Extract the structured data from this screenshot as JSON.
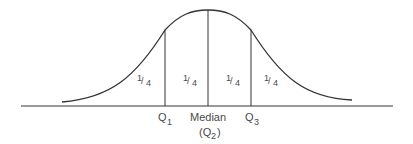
{
  "diagram": {
    "regions": [
      {
        "label_num": "1",
        "label_den": "4"
      },
      {
        "label_num": "1",
        "label_den": "4"
      },
      {
        "label_num": "1",
        "label_den": "4"
      },
      {
        "label_num": "1",
        "label_den": "4"
      }
    ],
    "markers": {
      "q1": {
        "main": "Q",
        "sub": "1"
      },
      "median": {
        "main": "Median",
        "paren_open": "(Q",
        "sub": "2",
        "paren_close": ")"
      },
      "q3": {
        "main": "Q",
        "sub": "3"
      }
    },
    "colors": {
      "line": "#333333",
      "text": "#4a4a4a"
    }
  }
}
